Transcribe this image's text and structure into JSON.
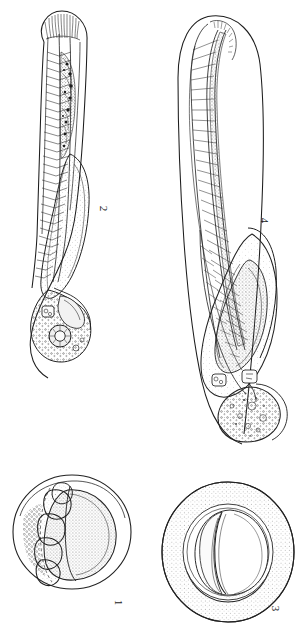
{
  "plate": {
    "title": "Embryonic development plate",
    "background_color": "#ffffff",
    "ink_color": "#1d1d1d",
    "stipple_color": "#4a4a4a",
    "width": 306,
    "height": 632,
    "orientation_note": "figure labels rotated 90 degrees clockwise"
  },
  "figures": [
    {
      "number": "1",
      "label": "1",
      "name": "early-cleavage-embryo",
      "position": "bottom-left",
      "description": "Spherical egg within chorion showing large blastomeres along one margin and a stippled yolk mass",
      "shape": "circle"
    },
    {
      "number": "2",
      "label": "2",
      "name": "mid-stage-larva",
      "position": "top-left",
      "description": "Elongate embryo with segmented somites, notochord, pigmented spinal region, large yolk sac and head with eye",
      "shape": "elongate"
    },
    {
      "number": "3",
      "label": "3",
      "name": "blastula-in-chorion",
      "position": "bottom-right",
      "description": "Spherical egg with broad stippled perivitelline ring enclosing an inner sphere divided by a cleavage furrow",
      "shape": "circle"
    },
    {
      "number": "4",
      "label": "4",
      "name": "late-stage-larva",
      "position": "top-right",
      "description": "Curved embryo within chorion, dense somite column, coiled gut and large stippled yolk mass with head bearing otic vesicles",
      "shape": "elongate-curved"
    }
  ],
  "labels": {
    "fig1": "1",
    "fig2": "2",
    "fig3": "3",
    "fig4": "4"
  }
}
